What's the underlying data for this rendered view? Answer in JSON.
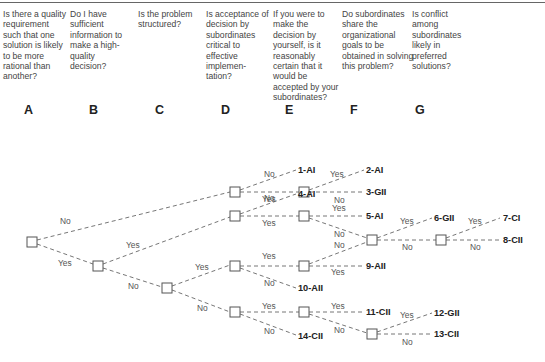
{
  "questions": [
    {
      "id": "A",
      "text": "Is there a quality requirement such that one solution is likely to be more rational than another?"
    },
    {
      "id": "B",
      "text": "Do I have sufficient information to make a high-quality decision?"
    },
    {
      "id": "C",
      "text": "Is the problem structured?"
    },
    {
      "id": "D",
      "text": "Is acceptance of decision by subordinates critical to effective implemen-tation?"
    },
    {
      "id": "E",
      "text": "If you were to make the decision by yourself, is it reasonably certain that it would be accepted by your subordinates?"
    },
    {
      "id": "F",
      "text": "Do subordinates share the organizational goals to be obtained in solving this problem?"
    },
    {
      "id": "G",
      "text": "Is conflict among subordinates likely in preferred solutions?"
    }
  ],
  "columns": [
    "A",
    "B",
    "C",
    "D",
    "E",
    "F",
    "G"
  ],
  "branch_labels": {
    "yes": "Yes",
    "no": "No"
  },
  "outcomes": [
    "1-AI",
    "2-AI",
    "3-GII",
    "4-AI",
    "5-AI",
    "6-GII",
    "7-CI",
    "8-CII",
    "9-AII",
    "10-AII",
    "11-CII",
    "12-GII",
    "13-CII",
    "14-CII"
  ]
}
